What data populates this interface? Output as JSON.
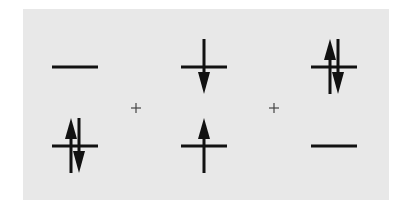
{
  "diagram": {
    "colors": {
      "background": "#ffffff",
      "panel": "#e8e8e8",
      "ink": "#111111",
      "plus": "#444444"
    },
    "operators": [
      {
        "symbol": "+",
        "x": 136,
        "y": 108
      },
      {
        "symbol": "+",
        "x": 274,
        "y": 108
      }
    ],
    "configurations": [
      {
        "name": "config-1",
        "upper": {
          "x": 52,
          "y": 67,
          "electrons": []
        },
        "lower": {
          "x": 52,
          "y": 146,
          "electrons": [
            "up",
            "down"
          ]
        }
      },
      {
        "name": "config-2",
        "upper": {
          "x": 181,
          "y": 67,
          "electrons": [
            "down"
          ]
        },
        "lower": {
          "x": 181,
          "y": 146,
          "electrons": [
            "up"
          ]
        }
      },
      {
        "name": "config-3",
        "upper": {
          "x": 311,
          "y": 67,
          "electrons": [
            "up",
            "down"
          ]
        },
        "lower": {
          "x": 311,
          "y": 146,
          "electrons": []
        }
      }
    ],
    "level_width": 46
  }
}
